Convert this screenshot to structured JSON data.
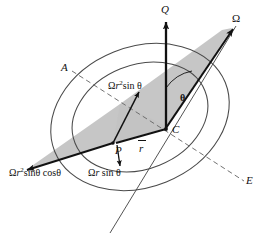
{
  "figure": {
    "colors": {
      "stroke": "#4a4a4a",
      "vector": "#111111",
      "shade": "#c3c3c3",
      "text": "#111111",
      "background": "#ffffff"
    },
    "points": {
      "center": "C",
      "particle": "P",
      "axis_left": "A",
      "axis_right": "E",
      "pole": "Q"
    },
    "vectors": {
      "omega": "Ω",
      "q_axis": "Q",
      "radius": "r",
      "omega_r2_sin_theta": {
        "prefix": "Ω",
        "var": "r",
        "exponent": "2",
        "suffix": "sin θ",
        "full": "Ωr²sin θ"
      },
      "omega_r_sin_theta": {
        "prefix": "Ω",
        "var": "r",
        "suffix": "sin θ",
        "full": "Ωr sin θ"
      },
      "omega_r2_sin_cos": {
        "prefix": "Ω",
        "var": "r",
        "exponent": "2",
        "suffix": "sinθ cosθ",
        "full": "Ωr²sinθ cosθ"
      }
    },
    "angles": {
      "theta": "θ"
    }
  }
}
